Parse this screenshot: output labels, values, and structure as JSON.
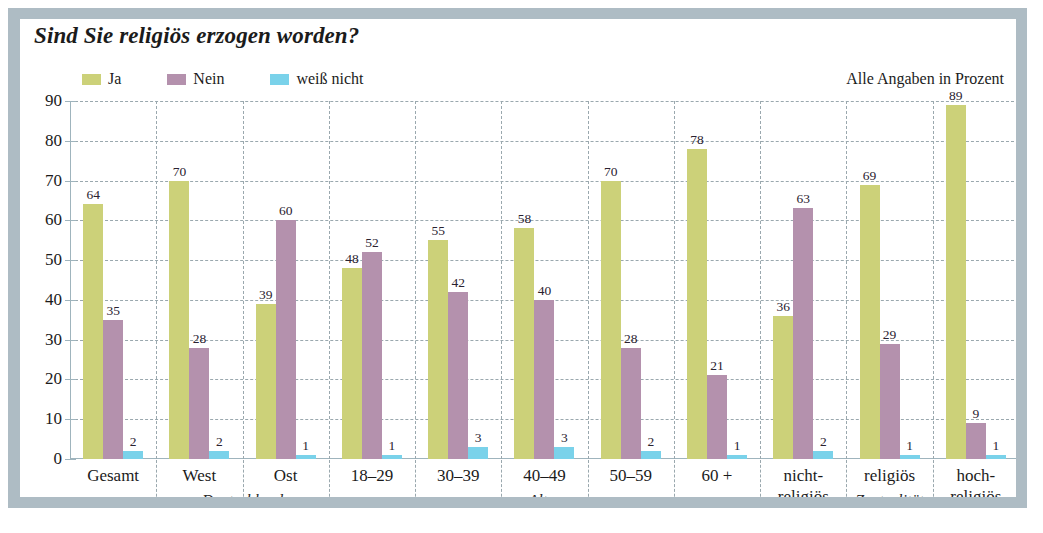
{
  "chart_data": {
    "type": "bar",
    "title": "Sind Sie religiös erzogen worden?",
    "note": "Alle Angaben in Prozent",
    "xlabel": "",
    "ylabel": "",
    "ylim": [
      0,
      90
    ],
    "yticks": [
      0,
      10,
      20,
      30,
      40,
      50,
      60,
      70,
      80,
      90
    ],
    "grid": true,
    "legend_position": "top-left",
    "categories": [
      "Gesamt",
      "West",
      "Ost",
      "18–29",
      "30–39",
      "40–49",
      "50–59",
      "60 +",
      "nicht-\nreligiös",
      "religiös",
      "hoch-\nreligiös"
    ],
    "category_labels": [
      [
        "Gesamt"
      ],
      [
        "West"
      ],
      [
        "Ost"
      ],
      [
        "18–29"
      ],
      [
        "30–39"
      ],
      [
        "40–49"
      ],
      [
        "50–59"
      ],
      [
        "60 +"
      ],
      [
        "nicht-",
        "religiös"
      ],
      [
        "religiös"
      ],
      [
        "hoch-",
        "religiös"
      ]
    ],
    "group_labels": [
      {
        "text": "Deutschland",
        "spans": [
          1,
          2
        ]
      },
      {
        "text": "Alter",
        "spans": [
          3,
          7
        ]
      },
      {
        "text": "Zentralität",
        "spans": [
          8,
          10
        ]
      }
    ],
    "series": [
      {
        "name": "Ja",
        "color": "#ccd179",
        "values": [
          64,
          70,
          39,
          48,
          55,
          58,
          70,
          78,
          36,
          69,
          89
        ]
      },
      {
        "name": "Nein",
        "color": "#b491ad",
        "values": [
          35,
          28,
          60,
          52,
          42,
          40,
          28,
          21,
          63,
          29,
          9
        ]
      },
      {
        "name": "weiß nicht",
        "color": "#7ad2ea",
        "values": [
          2,
          2,
          1,
          1,
          3,
          3,
          2,
          1,
          2,
          1,
          1
        ]
      }
    ],
    "colors": {
      "frame": "#aebcc4",
      "axis": "#9fb4bd",
      "grid": "#9aa8ae",
      "text": "#1b1b1b",
      "background": "#ffffff"
    }
  }
}
